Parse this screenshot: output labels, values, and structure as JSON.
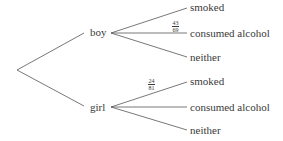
{
  "tree": {
    "root": "",
    "level1": [
      {
        "label": "boy",
        "children": [
          {
            "label": "smoked",
            "probability": ""
          },
          {
            "label": "consumed alcohol",
            "probability": {
              "num": "43",
              "den": "69"
            }
          },
          {
            "label": "neither",
            "probability": ""
          }
        ]
      },
      {
        "label": "girl",
        "children": [
          {
            "label": "smoked",
            "probability": {
              "num": "24",
              "den": "81"
            }
          },
          {
            "label": "consumed alcohol",
            "probability": ""
          },
          {
            "label": "neither",
            "probability": ""
          }
        ]
      }
    ]
  },
  "colors": {
    "line": "#555555",
    "text": "#3a3a3a",
    "background": "#ffffff"
  }
}
